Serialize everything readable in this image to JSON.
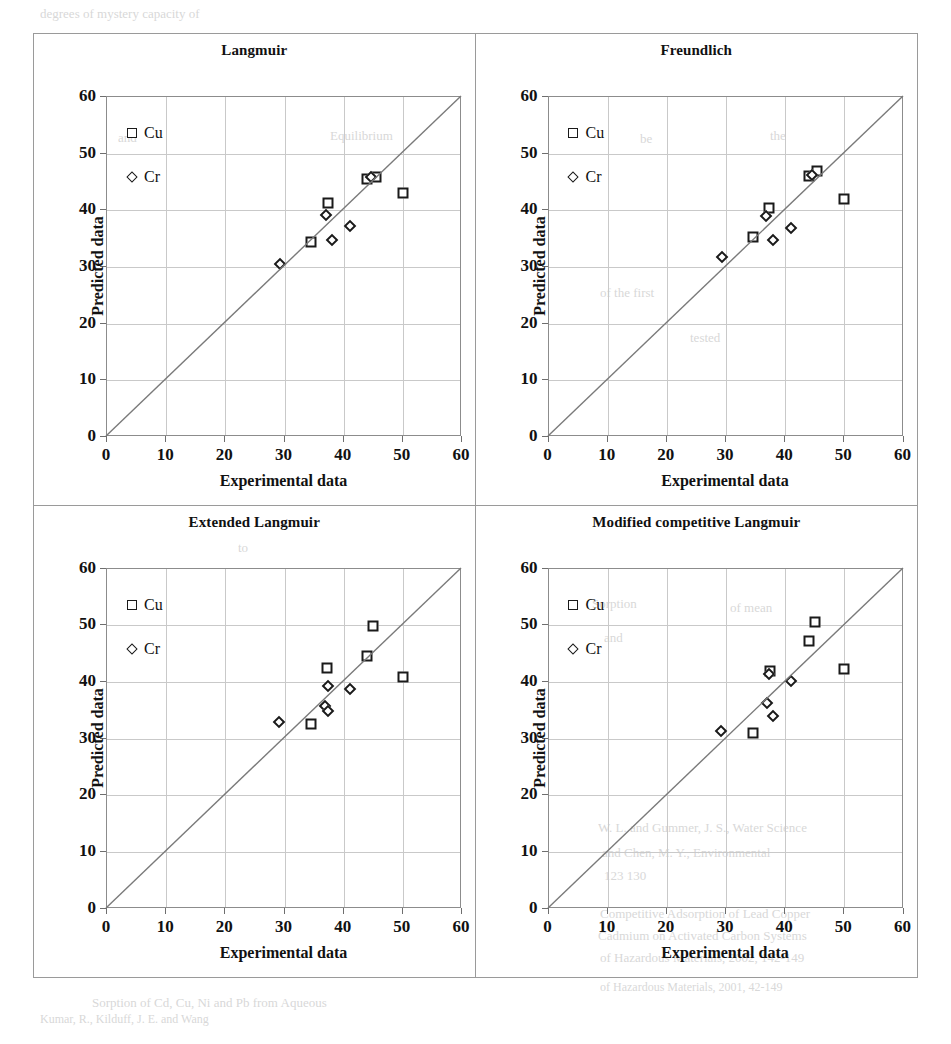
{
  "figure": {
    "axis_x_title": "Experimental data",
    "axis_y_title": "Predicted data",
    "legend": [
      {
        "label": "Cu",
        "marker": "square-marker"
      },
      {
        "label": "Cr",
        "marker": "diamond-marker"
      }
    ]
  },
  "ghost_text": [
    {
      "text": "degrees of mystery capacity of",
      "x": 40,
      "y": 6,
      "size": 13
    },
    {
      "text": "and",
      "x": 118,
      "y": 130,
      "size": 13
    },
    {
      "text": "Equilibrium",
      "x": 330,
      "y": 128,
      "size": 13
    },
    {
      "text": "be",
      "x": 640,
      "y": 131,
      "size": 13
    },
    {
      "text": "the",
      "x": 770,
      "y": 128,
      "size": 13
    },
    {
      "text": "of the first",
      "x": 600,
      "y": 285,
      "size": 13
    },
    {
      "text": "tested",
      "x": 690,
      "y": 330,
      "size": 13
    },
    {
      "text": "to",
      "x": 238,
      "y": 540,
      "size": 13
    },
    {
      "text": "Sorption",
      "x": 592,
      "y": 596,
      "size": 13
    },
    {
      "text": "of mean",
      "x": 730,
      "y": 600,
      "size": 13
    },
    {
      "text": "and",
      "x": 604,
      "y": 630,
      "size": 13
    },
    {
      "text": "W. L. and Gummer, J. S., Water Science",
      "x": 598,
      "y": 820,
      "size": 13
    },
    {
      "text": "and Chen, M. Y., Environmental",
      "x": 602,
      "y": 845,
      "size": 13
    },
    {
      "text": "123 130",
      "x": 604,
      "y": 868,
      "size": 13
    },
    {
      "text": "Competitive Adsorption of Lead Copper",
      "x": 600,
      "y": 906,
      "size": 13
    },
    {
      "text": "Cadmium on Activated Carbon Systems",
      "x": 598,
      "y": 928,
      "size": 13
    },
    {
      "text": "of Hazardous Materials, 2002, 142-149",
      "x": 600,
      "y": 950,
      "size": 13
    },
    {
      "text": "Sorption of Cd, Cu, Ni and Pb from Aqueous",
      "x": 92,
      "y": 995,
      "size": 13
    },
    {
      "text": "of Hazardous Materials, 2001, 42-149",
      "x": 600,
      "y": 980,
      "size": 12
    },
    {
      "text": "Kumar, R., Kilduff, J. E. and Wang",
      "x": 40,
      "y": 1012,
      "size": 12
    }
  ],
  "chart_data": [
    {
      "type": "scatter",
      "title": "Langmuir",
      "xlabel": "Experimental data",
      "ylabel": "Predicted data",
      "xlim": [
        0,
        60
      ],
      "ylim": [
        0,
        60
      ],
      "xticks": [
        0,
        10,
        20,
        30,
        40,
        50,
        60
      ],
      "yticks": [
        0,
        10,
        20,
        30,
        40,
        50,
        60
      ],
      "grid": true,
      "legend_position": "top-left",
      "reference_line": {
        "type": "identity",
        "from": [
          0,
          0
        ],
        "to": [
          60,
          60
        ]
      },
      "series": [
        {
          "name": "Cu",
          "marker": "square",
          "points": [
            [
              34.5,
              34.5
            ],
            [
              37.3,
              41.3
            ],
            [
              44.0,
              45.5
            ],
            [
              45.5,
              45.8
            ],
            [
              50.0,
              43.0
            ]
          ]
        },
        {
          "name": "Cr",
          "marker": "diamond",
          "points": [
            [
              29.2,
              30.5
            ],
            [
              37.0,
              39.2
            ],
            [
              38.0,
              34.8
            ],
            [
              41.0,
              37.3
            ],
            [
              44.6,
              45.8
            ]
          ]
        }
      ]
    },
    {
      "type": "scatter",
      "title": "Freundlich",
      "xlabel": "Experimental data",
      "ylabel": "Predicted data",
      "xlim": [
        0,
        60
      ],
      "ylim": [
        0,
        60
      ],
      "xticks": [
        0,
        10,
        20,
        30,
        40,
        50,
        60
      ],
      "yticks": [
        0,
        10,
        20,
        30,
        40,
        50,
        60
      ],
      "grid": true,
      "legend_position": "top-left",
      "reference_line": {
        "type": "identity",
        "from": [
          0,
          0
        ],
        "to": [
          60,
          60
        ]
      },
      "series": [
        {
          "name": "Cu",
          "marker": "square",
          "points": [
            [
              34.5,
              35.3
            ],
            [
              37.2,
              40.5
            ],
            [
              44.0,
              46.0
            ],
            [
              45.3,
              47.0
            ],
            [
              50.0,
              42.0
            ]
          ]
        },
        {
          "name": "Cr",
          "marker": "diamond",
          "points": [
            [
              29.3,
              31.7
            ],
            [
              36.8,
              39.0
            ],
            [
              37.9,
              34.7
            ],
            [
              41.0,
              36.8
            ],
            [
              44.6,
              46.2
            ]
          ]
        }
      ]
    },
    {
      "type": "scatter",
      "title": "Extended Langmuir",
      "xlabel": "Experimental data",
      "ylabel": "Predicted data",
      "xlim": [
        0,
        60
      ],
      "ylim": [
        0,
        60
      ],
      "xticks": [
        0,
        10,
        20,
        30,
        40,
        50,
        60
      ],
      "yticks": [
        0,
        10,
        20,
        30,
        40,
        50,
        60
      ],
      "grid": true,
      "legend_position": "top-left",
      "reference_line": {
        "type": "identity",
        "from": [
          0,
          0
        ],
        "to": [
          60,
          60
        ]
      },
      "series": [
        {
          "name": "Cu",
          "marker": "square",
          "points": [
            [
              34.5,
              32.5
            ],
            [
              37.2,
              42.5
            ],
            [
              44.0,
              44.6
            ],
            [
              45.0,
              49.8
            ],
            [
              50.0,
              40.8
            ]
          ]
        },
        {
          "name": "Cr",
          "marker": "diamond",
          "points": [
            [
              29.0,
              33.0
            ],
            [
              36.8,
              35.7
            ],
            [
              37.3,
              34.8
            ],
            [
              37.4,
              39.2
            ],
            [
              41.0,
              38.7
            ]
          ]
        }
      ]
    },
    {
      "type": "scatter",
      "title": "Modified competitive Langmuir",
      "xlabel": "Experimental data",
      "ylabel": "Predicted data",
      "xlim": [
        0,
        60
      ],
      "ylim": [
        0,
        60
      ],
      "xticks": [
        0,
        10,
        20,
        30,
        40,
        50,
        60
      ],
      "yticks": [
        0,
        10,
        20,
        30,
        40,
        50,
        60
      ],
      "grid": true,
      "legend_position": "top-left",
      "reference_line": {
        "type": "identity",
        "from": [
          0,
          0
        ],
        "to": [
          60,
          60
        ]
      },
      "series": [
        {
          "name": "Cu",
          "marker": "square",
          "points": [
            [
              34.6,
              31.0
            ],
            [
              37.4,
              42.0
            ],
            [
              44.0,
              47.2
            ],
            [
              45.0,
              50.5
            ],
            [
              50.0,
              42.3
            ]
          ]
        },
        {
          "name": "Cr",
          "marker": "diamond",
          "points": [
            [
              29.2,
              31.3
            ],
            [
              36.9,
              36.3
            ],
            [
              37.2,
              41.3
            ],
            [
              37.9,
              34.0
            ],
            [
              41.0,
              40.1
            ]
          ]
        }
      ]
    }
  ]
}
